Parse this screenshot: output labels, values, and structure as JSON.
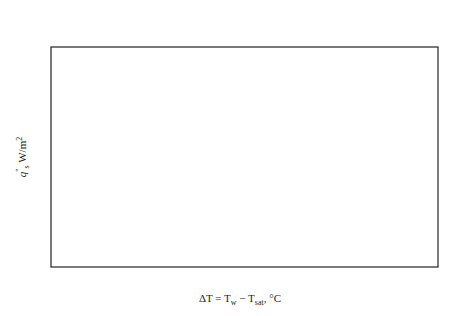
{
  "regimes": [
    {
      "line1": "Natural convection",
      "line2": "boiling",
      "from": 1,
      "to": 5
    },
    {
      "line1": "Nucleate",
      "line2": "boiling",
      "from": 5,
      "to": 30
    },
    {
      "line1": "Transition",
      "line2": "boiling",
      "from": 30,
      "to": 120
    },
    {
      "line1": "Film",
      "line2": "boiling",
      "from": 120,
      "to": 5000
    }
  ],
  "chart_data": {
    "type": "line",
    "title": "",
    "xlabel": "ΔT = Tw − Tsat, °C",
    "xlabel_parts": {
      "delta_t": "ΔT = T",
      "w": "w",
      "minus": " − T",
      "sat": "sat",
      "unit": ", °C"
    },
    "ylabel": "q\"s W/m²",
    "ylabel_parts": {
      "q": "q",
      "prime": "\"",
      "s": "s",
      "unit": " W/m",
      "exp": "2"
    },
    "x_scale": "log",
    "y_scale": "log",
    "xlim": [
      1,
      5000
    ],
    "ylim": [
      1000,
      10000000
    ],
    "x_ticks": [
      {
        "value": 1,
        "label": "1"
      },
      {
        "value": 5,
        "label": "~5"
      },
      {
        "value": 10,
        "label": "10"
      },
      {
        "value": 30,
        "label": "~30"
      },
      {
        "value": 100,
        "label": "100"
      },
      {
        "value": 120,
        "label": "~120"
      },
      {
        "value": 1000,
        "label": "1000"
      }
    ],
    "y_ticks": [
      {
        "value": 1000,
        "base": "10",
        "exp": "3"
      },
      {
        "value": 10000,
        "base": "10",
        "exp": "4"
      },
      {
        "value": 100000,
        "base": "10",
        "exp": "5"
      },
      {
        "value": 1000000,
        "base": "10",
        "exp": "6"
      }
    ],
    "series": [
      {
        "name": "natural-nucleate",
        "style": "solid",
        "points": [
          [
            1,
            1000
          ],
          [
            2,
            1800
          ],
          [
            3,
            2800
          ],
          [
            4,
            4000
          ],
          [
            5,
            5500
          ],
          [
            7,
            13000
          ],
          [
            10,
            40000
          ],
          [
            13,
            90000
          ],
          [
            18,
            250000
          ],
          [
            24,
            600000
          ],
          [
            30,
            1100000
          ]
        ]
      },
      {
        "name": "transition",
        "style": "dashed",
        "points": [
          [
            30,
            1100000
          ],
          [
            38,
            1000000
          ],
          [
            48,
            600000
          ],
          [
            60,
            230000
          ],
          [
            75,
            80000
          ],
          [
            95,
            32000
          ],
          [
            120,
            15000
          ]
        ]
      },
      {
        "name": "film",
        "style": "solid",
        "points": [
          [
            120,
            15000
          ],
          [
            200,
            30000
          ],
          [
            400,
            90000
          ],
          [
            800,
            350000
          ],
          [
            1200,
            900000
          ],
          [
            2000,
            2300000
          ],
          [
            5000,
            7500000
          ]
        ]
      }
    ],
    "points": [
      {
        "label": "A",
        "x": 5,
        "y": 5500
      },
      {
        "label": "B",
        "x": 10,
        "y": 40000
      },
      {
        "label": "C",
        "x": 30,
        "y": 1100000
      },
      {
        "label": "D",
        "x": 120,
        "y": 15000
      },
      {
        "label": "E",
        "x": 1200,
        "y": 900000
      }
    ],
    "guides": {
      "vertical_x": [
        5,
        10,
        30,
        120
      ],
      "qmax_y": 1000000,
      "qmin_y": 15000
    },
    "annotations": {
      "collapse": [
        "Bubbles",
        "collapse",
        "in the",
        "liquid"
      ],
      "rise": [
        "Bubbles",
        "rise to the",
        "free surface"
      ],
      "qmax": {
        "line1": "Maximum",
        "line2": "(critical)",
        "line3": "heat flux, q̇",
        "sub": "max"
      },
      "qmin": {
        "text": "Leidenfrost point, q̇",
        "sub": "min"
      }
    }
  }
}
